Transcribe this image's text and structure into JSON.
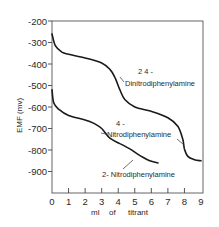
{
  "chart_data": {
    "type": "line",
    "title": "",
    "xlabel": "ml of titrant",
    "ylabel": "EMF (mv)",
    "xlim": [
      0,
      9
    ],
    "ylim": [
      -1000,
      -200
    ],
    "x_ticks": [
      0,
      1,
      2,
      3,
      4,
      5,
      6,
      7,
      8,
      9
    ],
    "y_ticks": [
      -200,
      -300,
      -400,
      -500,
      -600,
      -700,
      -800,
      -900
    ],
    "grid": false,
    "legend": "inline labels",
    "series": [
      {
        "name": "2,4-Dinitrodiphenylamine",
        "label_lines": [
          "2 4 -",
          "Dinitrodiphenylamine"
        ],
        "x": [
          0.0,
          0.2,
          0.6,
          1.0,
          2.0,
          3.0,
          3.5,
          3.8,
          4.1,
          4.4,
          5.0,
          6.0,
          7.0,
          7.6,
          7.9,
          8.0,
          8.2,
          8.6,
          9.0
        ],
        "y": [
          -260,
          -315,
          -345,
          -355,
          -372,
          -395,
          -425,
          -462,
          -520,
          -565,
          -600,
          -620,
          -650,
          -690,
          -750,
          -795,
          -830,
          -845,
          -850
        ]
      },
      {
        "name": "4-Nitrodiphenylamine",
        "label_lines": [
          "4 -",
          "Nitrodiphenylamine"
        ],
        "note": "label leader points to the step near 8 ml of the 2,4-dinitro curve region"
      },
      {
        "name": "2-Nitrodiphenylamine",
        "label_lines": [
          "2- Nitrodiphenylamine"
        ],
        "x": [
          0.0,
          0.1,
          0.4,
          1.0,
          2.0,
          2.5,
          3.0,
          3.5,
          4.1,
          4.7,
          5.3,
          5.9,
          6.4
        ],
        "y": [
          -520,
          -580,
          -610,
          -640,
          -660,
          -675,
          -700,
          -745,
          -770,
          -795,
          -825,
          -850,
          -860
        ]
      }
    ]
  },
  "axes": {
    "x_tick_labels": [
      "0",
      "1",
      "2",
      "3",
      "4",
      "5",
      "6",
      "7",
      "8",
      "9"
    ],
    "y_tick_labels": [
      "-200",
      "-300",
      "-400",
      "-500",
      "-600",
      "-700",
      "-800",
      "-900"
    ],
    "xlabel_words": [
      "ml",
      "of",
      "titrant"
    ],
    "ylabel": "EMF  (mv)"
  },
  "labels": {
    "dinitro_line1": "2 4 -",
    "dinitro_line2": "Dinitrodiphenylamine",
    "nitro4_line1": "4 -",
    "nitro4_line2": "Nitrodiphenylamine",
    "nitro2": "2- Nitrodiphenylamine"
  }
}
